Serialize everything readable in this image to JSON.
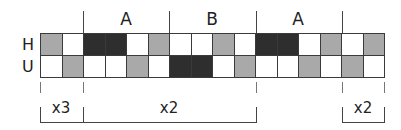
{
  "diagram": {
    "row_labels": [
      "H",
      "U"
    ],
    "section_labels": [
      {
        "text": "A",
        "x": 126
      },
      {
        "text": "B",
        "x": 212
      },
      {
        "text": "A",
        "x": 298
      }
    ],
    "multipliers": [
      {
        "text": "x3",
        "x": 61
      },
      {
        "text": "x2",
        "x": 169
      },
      {
        "text": "x2",
        "x": 363
      }
    ],
    "colors": {
      "white": "#ffffff",
      "gray": "#a9a9a9",
      "dark": "#2e2e2e"
    },
    "rows": {
      "H": [
        "gray",
        "white",
        "dark",
        "dark",
        "white",
        "gray",
        "white",
        "white",
        "gray",
        "white",
        "dark",
        "dark",
        "white",
        "gray",
        "white",
        "gray"
      ],
      "U": [
        "white",
        "gray",
        "white",
        "white",
        "gray",
        "white",
        "dark",
        "dark",
        "white",
        "gray",
        "white",
        "white",
        "gray",
        "white",
        "gray",
        "white"
      ]
    }
  }
}
